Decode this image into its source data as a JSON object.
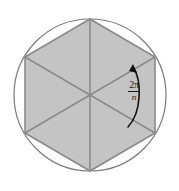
{
  "figure": {
    "background_color": "#ffffff",
    "circle": {
      "center_x": 90,
      "center_y": 95,
      "radius": 76,
      "stroke_color": "#7b7b7b",
      "stroke_width": 1.2,
      "fill": "none"
    },
    "polygon": {
      "sides": 6,
      "fill_color": "#c4c4c4",
      "stroke_color": "#8a8a8a",
      "stroke_width": 1.6,
      "vertices": [
        {
          "x": 90,
          "y": 19
        },
        {
          "x": 155,
          "y": 57
        },
        {
          "x": 155,
          "y": 133
        },
        {
          "x": 90,
          "y": 171
        },
        {
          "x": 25,
          "y": 133
        },
        {
          "x": 25,
          "y": 57
        }
      ]
    },
    "radii": {
      "stroke_color": "#8a8a8a",
      "stroke_width": 1.5,
      "count": 6
    },
    "angle_arc": {
      "stroke_color": "#111111",
      "stroke_width": 1.6,
      "start_x": 128,
      "start_y": 127,
      "end_x": 133,
      "end_y": 67,
      "arrow": "arrowhead-up-left"
    },
    "angle_label": {
      "numerator": "2π",
      "denominator": "n",
      "full_text": "2π/n",
      "color": "#1c1c1c"
    }
  }
}
